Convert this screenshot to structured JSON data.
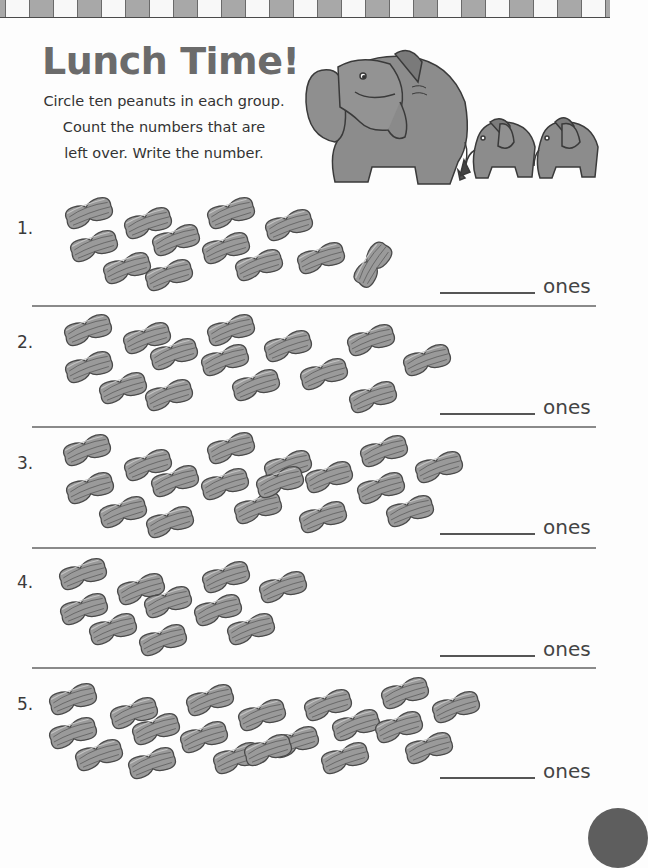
{
  "worksheet": {
    "title": "Lunch Time!",
    "instructions": [
      "Circle ten peanuts in each group.",
      "Count the numbers that are",
      "left over. Write the number."
    ],
    "illustration": "elephant-family-icon",
    "colors": {
      "title": "#6b6b6b",
      "peanut_fill": "#9a9a9a",
      "peanut_stroke": "#4a4a4a",
      "border_gray": "#a8a8a8",
      "separator": "#8a8a8a"
    },
    "answer_unit": "ones"
  },
  "problems": [
    {
      "number": "1.",
      "peanut_count": 12,
      "answer_label": "ones",
      "answer_value": ""
    },
    {
      "number": "2.",
      "peanut_count": 14,
      "answer_label": "ones",
      "answer_value": ""
    },
    {
      "number": "3.",
      "peanut_count": 17,
      "answer_label": "ones",
      "answer_value": ""
    },
    {
      "number": "4.",
      "peanut_count": 10,
      "answer_label": "ones",
      "answer_value": ""
    },
    {
      "number": "5.",
      "peanut_count": 19,
      "answer_label": "ones",
      "answer_value": ""
    }
  ],
  "peanuts": [
    [
      [
        88,
        213,
        -18
      ],
      [
        93,
        246,
        -18
      ],
      [
        126,
        268,
        -18
      ],
      [
        147,
        223,
        -18
      ],
      [
        175,
        240,
        -18
      ],
      [
        168,
        275,
        -18
      ],
      [
        230,
        213,
        -18
      ],
      [
        225,
        248,
        -18
      ],
      [
        258,
        265,
        -18
      ],
      [
        288,
        225,
        -18
      ],
      [
        320,
        258,
        -18
      ],
      [
        372,
        265,
        -55
      ]
    ],
    [
      [
        87,
        330,
        -18
      ],
      [
        88,
        367,
        -18
      ],
      [
        122,
        388,
        -18
      ],
      [
        146,
        338,
        -18
      ],
      [
        173,
        354,
        -18
      ],
      [
        168,
        395,
        -18
      ],
      [
        230,
        330,
        -18
      ],
      [
        224,
        360,
        -18
      ],
      [
        255,
        385,
        -18
      ],
      [
        287,
        346,
        -18
      ],
      [
        323,
        374,
        -18
      ],
      [
        370,
        340,
        -18
      ],
      [
        372,
        397,
        -18
      ],
      [
        426,
        360,
        -18
      ]
    ],
    [
      [
        86,
        450,
        -18
      ],
      [
        89,
        488,
        -18
      ],
      [
        122,
        512,
        -18
      ],
      [
        147,
        465,
        -18
      ],
      [
        174,
        481,
        -18
      ],
      [
        169,
        522,
        -18
      ],
      [
        230,
        448,
        -18
      ],
      [
        224,
        484,
        -18
      ],
      [
        257,
        508,
        -18
      ],
      [
        287,
        466,
        -18
      ],
      [
        328,
        477,
        -18
      ],
      [
        322,
        517,
        -18
      ],
      [
        383,
        451,
        -18
      ],
      [
        380,
        488,
        -18
      ],
      [
        409,
        511,
        -18
      ],
      [
        438,
        467,
        -18
      ],
      [
        279,
        482,
        -18
      ]
    ],
    [
      [
        82,
        574,
        -18
      ],
      [
        83,
        609,
        -18
      ],
      [
        112,
        629,
        -18
      ],
      [
        140,
        589,
        -18
      ],
      [
        167,
        602,
        -18
      ],
      [
        162,
        640,
        -18
      ],
      [
        225,
        577,
        -18
      ],
      [
        217,
        610,
        -18
      ],
      [
        250,
        629,
        -18
      ],
      [
        282,
        587,
        -18
      ]
    ],
    [
      [
        72,
        699,
        -18
      ],
      [
        72,
        733,
        -18
      ],
      [
        98,
        755,
        -18
      ],
      [
        133,
        713,
        -18
      ],
      [
        155,
        729,
        -18
      ],
      [
        151,
        763,
        -18
      ],
      [
        209,
        700,
        -18
      ],
      [
        203,
        737,
        -18
      ],
      [
        236,
        758,
        -18
      ],
      [
        261,
        715,
        -18
      ],
      [
        294,
        742,
        -18
      ],
      [
        327,
        705,
        -18
      ],
      [
        355,
        725,
        -18
      ],
      [
        344,
        758,
        -18
      ],
      [
        404,
        693,
        -18
      ],
      [
        398,
        727,
        -18
      ],
      [
        428,
        748,
        -18
      ],
      [
        455,
        707,
        -18
      ],
      [
        267,
        750,
        -18
      ]
    ]
  ]
}
